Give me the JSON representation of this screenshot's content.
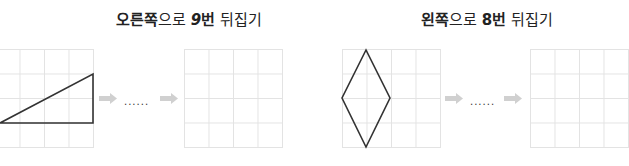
{
  "problems": [
    {
      "title_parts": {
        "direction": "오른쪽",
        "particle": "으로 ",
        "count": "9",
        "unit": "번",
        "action": " 뒤집기"
      },
      "shape": "right-triangle",
      "ellipsis": "......"
    },
    {
      "title_parts": {
        "direction": "왼쪽",
        "particle": "으로 ",
        "count": "8",
        "unit": "번",
        "action": " 뒤집기"
      },
      "shape": "rhombus",
      "ellipsis": "......"
    }
  ],
  "grid": {
    "rows": 4,
    "cols": 4
  },
  "colors": {
    "grid_line": "#e3e3e3",
    "shape_stroke": "#333333",
    "arrow": "#d0d0d0"
  }
}
